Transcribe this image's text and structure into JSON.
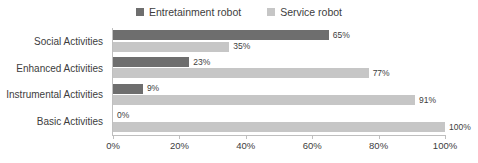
{
  "chart_data": {
    "type": "bar",
    "orientation": "horizontal",
    "title": "",
    "subtitle": "",
    "xlabel": "",
    "ylabel": "",
    "xlim": [
      0,
      100
    ],
    "xticks": [
      0,
      20,
      40,
      60,
      80,
      100
    ],
    "xtick_labels": [
      "0%",
      "20%",
      "40%",
      "60%",
      "80%",
      "100%"
    ],
    "grid": false,
    "legend_position": "top-center",
    "categories": [
      "Social Activities",
      "Enhanced Activities",
      "Instrumental Activities",
      "Basic Activities"
    ],
    "series": [
      {
        "name": "Entretainment robot",
        "color": "#6e6e6e",
        "values": [
          65,
          23,
          9,
          0
        ],
        "labels": [
          "65%",
          "23%",
          "9%",
          "0%"
        ]
      },
      {
        "name": "Service robot",
        "color": "#c6c6c6",
        "values": [
          35,
          77,
          91,
          100
        ],
        "labels": [
          "35%",
          "77%",
          "91%",
          "100%"
        ]
      }
    ]
  },
  "legend": {
    "entries": [
      {
        "label": "Entretainment robot",
        "color": "#6e6e6e"
      },
      {
        "label": "Service robot",
        "color": "#c6c6c6"
      }
    ]
  }
}
